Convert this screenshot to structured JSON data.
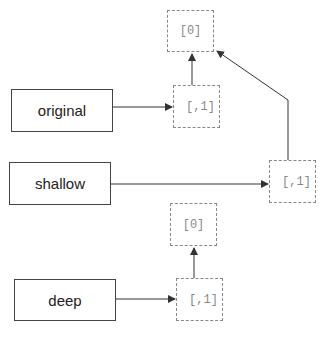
{
  "diagram": {
    "variables": [
      {
        "id": "original",
        "label": "original"
      },
      {
        "id": "shallow",
        "label": "shallow"
      },
      {
        "id": "deep",
        "label": "deep"
      }
    ],
    "cells": [
      {
        "id": "shared-inner",
        "label": "[0]"
      },
      {
        "id": "original-outer",
        "label": "[,1]"
      },
      {
        "id": "shallow-outer",
        "label": "[,1]"
      },
      {
        "id": "deep-inner",
        "label": "[0]"
      },
      {
        "id": "deep-outer",
        "label": "[,1]"
      }
    ],
    "edges": [
      {
        "from": "original",
        "to": "original-outer"
      },
      {
        "from": "original-outer",
        "to": "shared-inner"
      },
      {
        "from": "shallow",
        "to": "shallow-outer"
      },
      {
        "from": "shallow-outer",
        "to": "shared-inner"
      },
      {
        "from": "deep",
        "to": "deep-outer"
      },
      {
        "from": "deep-outer",
        "to": "deep-inner"
      }
    ],
    "colors": {
      "box_border": "#444444",
      "cell_border": "#888888",
      "cell_text": "#888888",
      "arrow": "#333333"
    }
  }
}
